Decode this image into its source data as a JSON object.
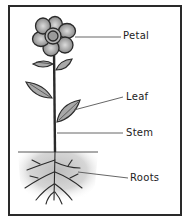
{
  "diagram": {
    "labels": [
      {
        "id": "petal",
        "text": "Petal",
        "x": 123,
        "y": 30
      },
      {
        "id": "leaf",
        "text": "Leaf",
        "x": 126,
        "y": 92
      },
      {
        "id": "stem",
        "text": "Stem",
        "x": 126,
        "y": 126
      },
      {
        "id": "roots",
        "text": "Roots",
        "x": 130,
        "y": 170
      }
    ],
    "colors": {
      "outline": "#2a2a2a",
      "petal_fill": "#8a8a8a",
      "leaf_fill": "#a8a8a8",
      "soil": "#cfcfcf",
      "background": "#ffffff"
    }
  }
}
